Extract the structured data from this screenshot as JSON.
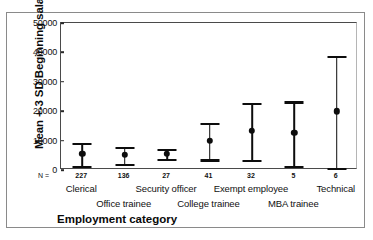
{
  "chart_data": {
    "type": "scatter",
    "title": "",
    "ylabel": "Mean +-3 SD Beginning salary",
    "xlabel": "Employment category",
    "ylim": [
      0,
      50000
    ],
    "yticks": [
      "0",
      "10000",
      "20000",
      "30000",
      "40000",
      "50000"
    ],
    "ytick_values": [
      0,
      10000,
      20000,
      30000,
      40000,
      50000
    ],
    "grid": false,
    "legend": "none",
    "n_label": "N =",
    "categories": [
      "Clerical",
      "Office trainee",
      "Security officer",
      "College trainee",
      "Exempt employee",
      "MBA trainee",
      "Technical"
    ],
    "n_values": [
      "227",
      "136",
      "27",
      "41",
      "32",
      "5",
      "6"
    ],
    "series": [
      {
        "name": "Mean +-3 SD Beginning salary",
        "points": [
          {
            "category": "Clerical",
            "n": "227",
            "mean": 5500,
            "lower": 1400,
            "upper": 9200
          },
          {
            "category": "Office trainee",
            "n": "136",
            "mean": 5200,
            "lower": 2100,
            "upper": 7900
          },
          {
            "category": "Security officer",
            "n": "27",
            "mean": 5600,
            "lower": 3900,
            "upper": 7300
          },
          {
            "category": "College trainee",
            "n": "41",
            "mean": 9900,
            "lower": 3700,
            "upper": 16000
          },
          {
            "category": "Exempt employee",
            "n": "32",
            "mean": 13300,
            "lower": 3400,
            "upper": 22800
          },
          {
            "category": "MBA trainee",
            "n": "5",
            "mean": 12700,
            "lower": 1500,
            "upper": 23400
          },
          {
            "category": "Technical",
            "n": "6",
            "mean": 19900,
            "lower": 700,
            "upper": 38800
          }
        ]
      }
    ],
    "colors": {
      "marker": "#0d0d0d",
      "axis": "#4a4a4a",
      "frame": "#8a8a8a",
      "background": "#ffffff"
    }
  }
}
